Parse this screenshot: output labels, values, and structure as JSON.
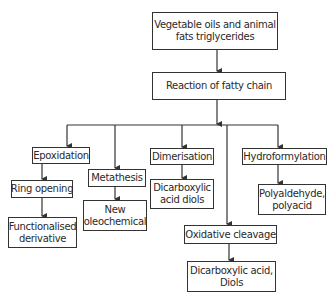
{
  "diagram": {
    "type": "flowchart",
    "nodes": {
      "root": "Vegetable oils and animal fats triglycerides",
      "root_line1": "Vegetable oils and animal",
      "root_line2": "fats triglycerides",
      "reaction": "Reaction of fatty chain",
      "epoxidation": "Epoxidation",
      "ring_opening": "Ring opening",
      "functionalised_line1": "Functionalised",
      "functionalised_line2": "derivative",
      "metathesis": "Metathesis",
      "new_oleo_line1": "New",
      "new_oleo_line2": "oleochemical",
      "dimerisation": "Dimerisation",
      "dicarb_diols_line1": "Dicarboxylic",
      "dicarb_diols_line2": "acid diols",
      "hydroformylation": "Hydroformylation",
      "polyald_line1": "Polyaldehyde,",
      "polyald_line2": "polyacid",
      "oxidative_cleavage": "Oxidative cleavage",
      "dicarb_acid_line1": "Dicarboxylic acid,",
      "dicarb_acid_line2": "Diols"
    },
    "edges": [
      [
        "Vegetable oils and animal fats triglycerides",
        "Reaction of fatty chain"
      ],
      [
        "Reaction of fatty chain",
        "Epoxidation"
      ],
      [
        "Reaction of fatty chain",
        "Metathesis"
      ],
      [
        "Reaction of fatty chain",
        "Dimerisation"
      ],
      [
        "Reaction of fatty chain",
        "Oxidative cleavage"
      ],
      [
        "Reaction of fatty chain",
        "Hydroformylation"
      ],
      [
        "Epoxidation",
        "Ring opening"
      ],
      [
        "Ring opening",
        "Functionalised derivative"
      ],
      [
        "Metathesis",
        "New oleochemical"
      ],
      [
        "Dimerisation",
        "Dicarboxylic acid diols"
      ],
      [
        "Hydroformylation",
        "Polyaldehyde, polyacid"
      ],
      [
        "Oxidative cleavage",
        "Dicarboxylic acid, Diols"
      ]
    ]
  }
}
